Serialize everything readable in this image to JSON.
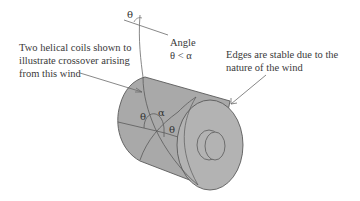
{
  "diagram": {
    "type": "annotated technical illustration",
    "colors": {
      "body_fill": "#a9a9a9",
      "face_fill": "#b3b3b3",
      "line": "#5a5a5a",
      "text": "#3a3a3a",
      "leader": "#6a6a6a"
    },
    "labels": {
      "coils_note": [
        "Two helical coils shown to",
        "illustrate crossover arising",
        "from this wind"
      ],
      "angle_note": [
        "Angle",
        "θ < α"
      ],
      "edges_note": [
        "Edges are stable due to the",
        "nature of the wind"
      ]
    },
    "symbols": {
      "theta_top": "θ",
      "theta_left": "θ",
      "theta_right": "θ",
      "alpha": "α"
    }
  }
}
